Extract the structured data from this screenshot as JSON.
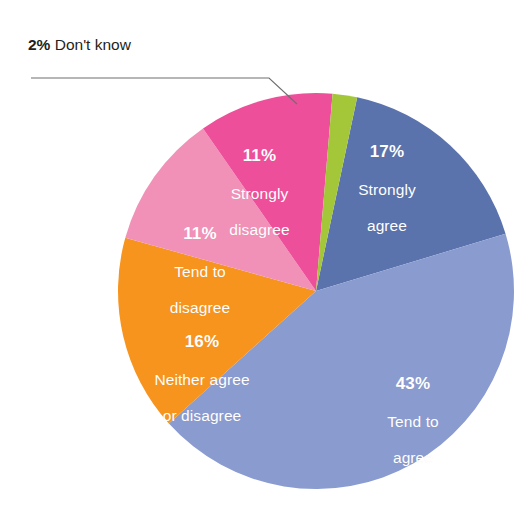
{
  "chart_data": {
    "type": "pie",
    "title": "",
    "subtitle": "",
    "xlabel": "",
    "ylabel": "",
    "legend_position": "none",
    "grid": false,
    "units": "percent",
    "total": 100,
    "start_angle_deg": 12,
    "direction": "clockwise",
    "categories": [
      "Strongly agree",
      "Tend to agree",
      "Neither agree or disagree",
      "Tend to disagree",
      "Strongly disagree",
      "Don't know"
    ],
    "values": [
      17,
      43,
      16,
      11,
      11,
      2
    ],
    "colors": [
      "#5a73ad",
      "#8a9bd0",
      "#f7941e",
      "#f191b8",
      "#ee4f9b",
      "#a4c639"
    ],
    "slices": [
      {
        "label": "Strongly agree",
        "label_line1": "Strongly",
        "label_line2": "agree",
        "value": 17,
        "percent_text": "17%",
        "color": "#5a73ad",
        "label_placement": "inside",
        "label_color": "#ffffff"
      },
      {
        "label": "Tend to agree",
        "label_line1": "Tend to",
        "label_line2": "agree",
        "value": 43,
        "percent_text": "43%",
        "color": "#8a9bd0",
        "label_placement": "inside",
        "label_color": "#ffffff"
      },
      {
        "label": "Neither agree or disagree",
        "label_line1": "Neither agree",
        "label_line2": "or disagree",
        "value": 16,
        "percent_text": "16%",
        "color": "#f7941e",
        "label_placement": "inside",
        "label_color": "#ffffff"
      },
      {
        "label": "Tend to disagree",
        "label_line1": "Tend to",
        "label_line2": "disagree",
        "value": 11,
        "percent_text": "11%",
        "color": "#f191b8",
        "label_placement": "inside",
        "label_color": "#ffffff"
      },
      {
        "label": "Strongly disagree",
        "label_line1": "Strongly",
        "label_line2": "disagree",
        "value": 11,
        "percent_text": "11%",
        "color": "#ee4f9b",
        "label_placement": "inside",
        "label_color": "#ffffff"
      },
      {
        "label": "Don't know",
        "label_line1": "Don't know",
        "label_line2": "",
        "value": 2,
        "percent_text": "2%",
        "color": "#a4c639",
        "label_placement": "callout",
        "label_color": "#231f20"
      }
    ]
  },
  "callout": {
    "percent_text": "2%",
    "label_text": " Don't know",
    "leader_color": "#6d6e71"
  },
  "geometry": {
    "center_x": 316,
    "center_y": 291,
    "radius": 198
  }
}
